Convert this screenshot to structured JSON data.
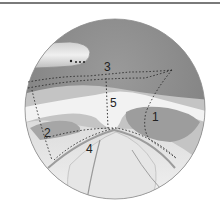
{
  "figure": {
    "type": "endoscopic anatomical illustration",
    "labels": [
      {
        "id": "1",
        "text": "1",
        "x": 152,
        "y": 121
      },
      {
        "id": "2",
        "text": "2",
        "x": 44,
        "y": 137
      },
      {
        "id": "3",
        "text": "3",
        "x": 104,
        "y": 71
      },
      {
        "id": "4",
        "text": "4",
        "x": 86,
        "y": 153
      },
      {
        "id": "5",
        "text": "5",
        "x": 110,
        "y": 107
      }
    ],
    "colors": {
      "rule": "#7a7a7a",
      "dark_tissue": "#8a8a8a",
      "mid_tissue": "#b8b8b8",
      "light_tissue": "#ececec",
      "dotted_line": "#222222",
      "background": "#ffffff"
    }
  }
}
